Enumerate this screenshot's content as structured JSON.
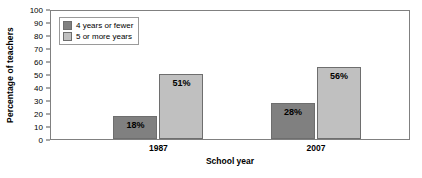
{
  "chart_data": {
    "type": "bar",
    "title": "",
    "xlabel": "School year",
    "ylabel": "Percentage of teachers",
    "categories": [
      "1987",
      "2007"
    ],
    "series": [
      {
        "name": "4 years or fewer",
        "values": [
          18,
          28
        ],
        "color": "#808080"
      },
      {
        "name": "5 or more years",
        "values": [
          51,
          56
        ],
        "color": "#c0c0c0"
      }
    ],
    "value_labels": [
      [
        "18%",
        "28%"
      ],
      [
        "51%",
        "56%"
      ]
    ],
    "ylim": [
      0,
      100
    ],
    "ytick_step": 10,
    "yticks": [
      "100",
      "90",
      "80",
      "70",
      "60",
      "50",
      "40",
      "30",
      "20",
      "10",
      "0"
    ],
    "grid": false,
    "legend_position": "top-left"
  }
}
